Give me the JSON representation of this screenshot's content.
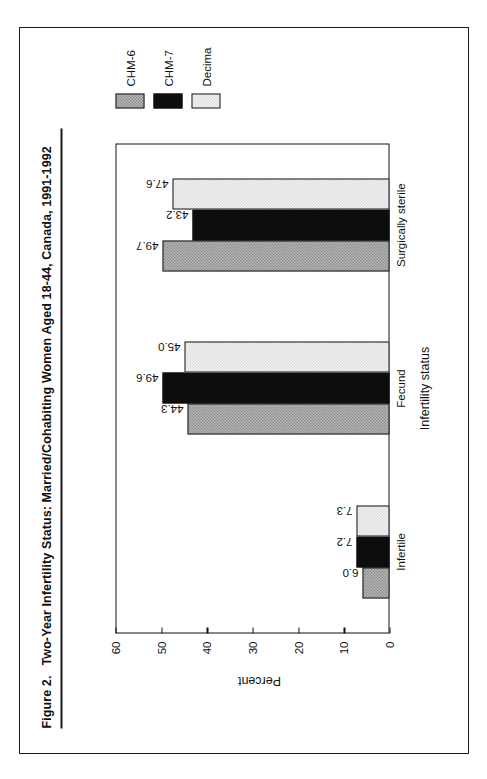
{
  "figure": {
    "number": "Figure 2.",
    "title": "Two-Year Infertility Status:  Married/Cohabiting Women Aged 18-44, Canada, 1991-1992"
  },
  "chart_data": {
    "type": "bar",
    "orientation": "vertical",
    "xlabel": "Infertility status",
    "ylabel": "Percent",
    "categories": [
      "Infertile",
      "Fecund",
      "Surgically sterile"
    ],
    "series": [
      {
        "name": "CHM-6",
        "values": [
          6.0,
          44.3,
          49.7
        ]
      },
      {
        "name": "CHM-7",
        "values": [
          7.2,
          49.6,
          43.2
        ]
      },
      {
        "name": "Decima",
        "values": [
          7.3,
          45.0,
          47.6
        ]
      }
    ],
    "ylim": [
      0,
      60
    ],
    "yticks": [
      0,
      10,
      20,
      30,
      40,
      50,
      60
    ],
    "ytick_labels": [
      "0",
      "10",
      "20",
      "30",
      "40",
      "50",
      "60"
    ],
    "grid": false,
    "legend_position": "right",
    "data_labels": [
      "6.0",
      "7.2",
      "7.3",
      "44.3",
      "49.6",
      "45.0",
      "49.7",
      "43.2",
      "47.6"
    ]
  },
  "legend": {
    "entries": [
      {
        "label": "CHM-6"
      },
      {
        "label": "CHM-7"
      },
      {
        "label": "Decima"
      }
    ]
  }
}
